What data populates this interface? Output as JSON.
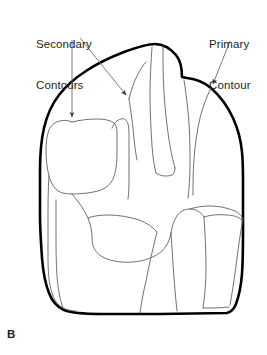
{
  "figure": {
    "panel_letter": "B",
    "labels": [
      {
        "id": "secondary",
        "line1": "Secondary",
        "line2": "Contours"
      },
      {
        "id": "primary",
        "line1": "Primary",
        "line2": "Contour"
      }
    ],
    "colors": {
      "text": "#231f20",
      "primary_outline": "#000000",
      "secondary_line": "#58595b",
      "leader_line": "#6d6e71",
      "background": "#ffffff"
    },
    "leaders": [
      {
        "id": "secondary-left",
        "from_x": 72,
        "from_y": 40,
        "to_x": 72,
        "to_y": 122
      },
      {
        "id": "secondary-right",
        "from_x": 79,
        "from_y": 38,
        "to_x": 129,
        "to_y": 99
      },
      {
        "id": "primary-right",
        "from_x": 229,
        "from_y": 42,
        "to_x": 211,
        "to_y": 88
      }
    ],
    "line_widths": {
      "primary_outline": 2.6,
      "secondary_line": 0.85,
      "leader_line": 0.9
    }
  }
}
